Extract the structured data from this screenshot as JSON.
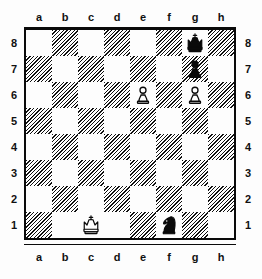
{
  "diagram": {
    "type": "chess-board-diagram",
    "orientation": "white-bottom",
    "files": [
      "a",
      "b",
      "c",
      "d",
      "e",
      "f",
      "g",
      "h"
    ],
    "ranks": [
      "8",
      "7",
      "6",
      "5",
      "4",
      "3",
      "2",
      "1"
    ],
    "colors": {
      "light_square": "#fdfdfd",
      "dark_square_hatch": "#111111",
      "piece_black": "#0a0a0a",
      "piece_white_outline": "#0a0a0a",
      "border": "#0a0a0a",
      "label_text": "#111111"
    },
    "squares": [
      [
        {
          "file": "a",
          "rank": "8",
          "shade": "light",
          "piece": null
        },
        {
          "file": "b",
          "rank": "8",
          "shade": "dark",
          "piece": null
        },
        {
          "file": "c",
          "rank": "8",
          "shade": "light",
          "piece": null
        },
        {
          "file": "d",
          "rank": "8",
          "shade": "dark",
          "piece": null
        },
        {
          "file": "e",
          "rank": "8",
          "shade": "light",
          "piece": null
        },
        {
          "file": "f",
          "rank": "8",
          "shade": "dark",
          "piece": null
        },
        {
          "file": "g",
          "rank": "8",
          "shade": "light",
          "piece": "black-king"
        },
        {
          "file": "h",
          "rank": "8",
          "shade": "dark",
          "piece": null
        }
      ],
      [
        {
          "file": "a",
          "rank": "7",
          "shade": "dark",
          "piece": null
        },
        {
          "file": "b",
          "rank": "7",
          "shade": "light",
          "piece": null
        },
        {
          "file": "c",
          "rank": "7",
          "shade": "dark",
          "piece": null
        },
        {
          "file": "d",
          "rank": "7",
          "shade": "light",
          "piece": null
        },
        {
          "file": "e",
          "rank": "7",
          "shade": "dark",
          "piece": null
        },
        {
          "file": "f",
          "rank": "7",
          "shade": "light",
          "piece": null
        },
        {
          "file": "g",
          "rank": "7",
          "shade": "dark",
          "piece": "black-pawn"
        },
        {
          "file": "h",
          "rank": "7",
          "shade": "light",
          "piece": null
        }
      ],
      [
        {
          "file": "a",
          "rank": "6",
          "shade": "light",
          "piece": null
        },
        {
          "file": "b",
          "rank": "6",
          "shade": "dark",
          "piece": null
        },
        {
          "file": "c",
          "rank": "6",
          "shade": "light",
          "piece": null
        },
        {
          "file": "d",
          "rank": "6",
          "shade": "dark",
          "piece": null
        },
        {
          "file": "e",
          "rank": "6",
          "shade": "light",
          "piece": "white-pawn"
        },
        {
          "file": "f",
          "rank": "6",
          "shade": "dark",
          "piece": null
        },
        {
          "file": "g",
          "rank": "6",
          "shade": "light",
          "piece": "white-pawn"
        },
        {
          "file": "h",
          "rank": "6",
          "shade": "dark",
          "piece": null
        }
      ],
      [
        {
          "file": "a",
          "rank": "5",
          "shade": "dark",
          "piece": null
        },
        {
          "file": "b",
          "rank": "5",
          "shade": "light",
          "piece": null
        },
        {
          "file": "c",
          "rank": "5",
          "shade": "dark",
          "piece": null
        },
        {
          "file": "d",
          "rank": "5",
          "shade": "light",
          "piece": null
        },
        {
          "file": "e",
          "rank": "5",
          "shade": "dark",
          "piece": null
        },
        {
          "file": "f",
          "rank": "5",
          "shade": "light",
          "piece": null
        },
        {
          "file": "g",
          "rank": "5",
          "shade": "dark",
          "piece": null
        },
        {
          "file": "h",
          "rank": "5",
          "shade": "light",
          "piece": null
        }
      ],
      [
        {
          "file": "a",
          "rank": "4",
          "shade": "light",
          "piece": null
        },
        {
          "file": "b",
          "rank": "4",
          "shade": "dark",
          "piece": null
        },
        {
          "file": "c",
          "rank": "4",
          "shade": "light",
          "piece": null
        },
        {
          "file": "d",
          "rank": "4",
          "shade": "dark",
          "piece": null
        },
        {
          "file": "e",
          "rank": "4",
          "shade": "light",
          "piece": null
        },
        {
          "file": "f",
          "rank": "4",
          "shade": "dark",
          "piece": null
        },
        {
          "file": "g",
          "rank": "4",
          "shade": "light",
          "piece": null
        },
        {
          "file": "h",
          "rank": "4",
          "shade": "dark",
          "piece": null
        }
      ],
      [
        {
          "file": "a",
          "rank": "3",
          "shade": "dark",
          "piece": null
        },
        {
          "file": "b",
          "rank": "3",
          "shade": "light",
          "piece": null
        },
        {
          "file": "c",
          "rank": "3",
          "shade": "dark",
          "piece": null
        },
        {
          "file": "d",
          "rank": "3",
          "shade": "light",
          "piece": null
        },
        {
          "file": "e",
          "rank": "3",
          "shade": "dark",
          "piece": null
        },
        {
          "file": "f",
          "rank": "3",
          "shade": "light",
          "piece": null
        },
        {
          "file": "g",
          "rank": "3",
          "shade": "dark",
          "piece": null
        },
        {
          "file": "h",
          "rank": "3",
          "shade": "light",
          "piece": null
        }
      ],
      [
        {
          "file": "a",
          "rank": "2",
          "shade": "light",
          "piece": null
        },
        {
          "file": "b",
          "rank": "2",
          "shade": "dark",
          "piece": null
        },
        {
          "file": "c",
          "rank": "2",
          "shade": "light",
          "piece": null
        },
        {
          "file": "d",
          "rank": "2",
          "shade": "dark",
          "piece": null
        },
        {
          "file": "e",
          "rank": "2",
          "shade": "light",
          "piece": null
        },
        {
          "file": "f",
          "rank": "2",
          "shade": "dark",
          "piece": null
        },
        {
          "file": "g",
          "rank": "2",
          "shade": "light",
          "piece": null
        },
        {
          "file": "h",
          "rank": "2",
          "shade": "dark",
          "piece": null
        }
      ],
      [
        {
          "file": "a",
          "rank": "1",
          "shade": "dark",
          "piece": null
        },
        {
          "file": "b",
          "rank": "1",
          "shade": "light",
          "piece": null
        },
        {
          "file": "c",
          "rank": "1",
          "shade": "light",
          "piece": "white-king"
        },
        {
          "file": "d",
          "rank": "1",
          "shade": "light",
          "piece": null
        },
        {
          "file": "e",
          "rank": "1",
          "shade": "dark",
          "piece": null
        },
        {
          "file": "f",
          "rank": "1",
          "shade": "light",
          "piece": "black-knight"
        },
        {
          "file": "g",
          "rank": "1",
          "shade": "dark",
          "piece": null
        },
        {
          "file": "h",
          "rank": "1",
          "shade": "light",
          "piece": null
        }
      ]
    ],
    "pieces": [
      {
        "piece": "black-king",
        "square": "g8",
        "color": "black",
        "kind": "king"
      },
      {
        "piece": "black-pawn",
        "square": "g7",
        "color": "black",
        "kind": "pawn"
      },
      {
        "piece": "white-pawn",
        "square": "e6",
        "color": "white",
        "kind": "pawn"
      },
      {
        "piece": "white-pawn",
        "square": "g6",
        "color": "white",
        "kind": "pawn"
      },
      {
        "piece": "white-king",
        "square": "c1",
        "color": "white",
        "kind": "king"
      },
      {
        "piece": "black-knight",
        "square": "f1",
        "color": "black",
        "kind": "knight"
      }
    ]
  }
}
